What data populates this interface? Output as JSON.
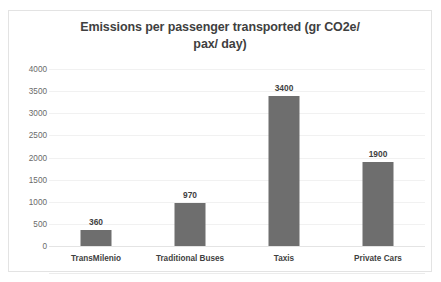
{
  "chart_data": {
    "type": "bar",
    "title": "Emissions per passenger transported (gr CO2e/ pax/ day)",
    "title_line1": "Emissions per passenger transported (gr CO2e/",
    "title_line2": "pax/ day)",
    "xlabel": "",
    "ylabel": "",
    "categories": [
      "TransMilenio",
      "Traditional Buses",
      "Taxis",
      "Private Cars"
    ],
    "values": [
      360,
      970,
      3400,
      1900
    ],
    "data_labels": [
      "360",
      "970",
      "3400",
      "1900"
    ],
    "ylim": [
      0,
      4000
    ],
    "ytick_step": 500,
    "yticks": [
      4000,
      3500,
      3000,
      2500,
      2000,
      1500,
      1000,
      500,
      0
    ],
    "ytick_labels": [
      "4000",
      "3500",
      "3000",
      "2500",
      "2000",
      "1500",
      "1000",
      "500",
      "0"
    ],
    "grid": true,
    "grid_axis": "y",
    "legend": false,
    "legend_position": "none",
    "colors": {
      "bar": "#6e6e6e",
      "title_text": "#3f3f3f",
      "tick_text": "#6a6a6a",
      "category_text": "#3f3f3f",
      "gridline": "#f1f1f1",
      "baseline": "#e4e4e4",
      "border": "#e3e3e3",
      "background": "#ffffff"
    }
  }
}
